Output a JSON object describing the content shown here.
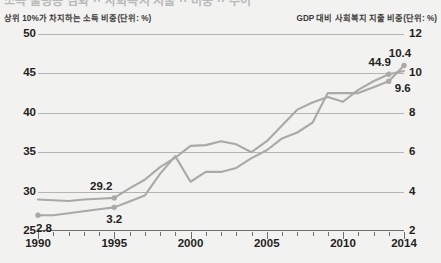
{
  "page": {
    "cropped_title_ghost": "소득 불평등 심화 ·· 사회복지 지출 ·· 비중 ·· 추이"
  },
  "axis_captions": {
    "left": "상위 10%가 차지하는 소득 비중(단위: %)",
    "right": "GDP 대비 사회복지 지출 비중(단위: %)"
  },
  "chart_data": {
    "type": "line",
    "title": "",
    "xlabel": "",
    "ylabel": "상위 10%가 차지하는 소득 비중(단위: %)",
    "y2label": "GDP 대비 사회복지 지출 비중(단위: %)",
    "grid": true,
    "legend": "none",
    "xlim": [
      1990,
      2014
    ],
    "ylim": [
      25,
      50
    ],
    "y2lim": [
      2,
      12
    ],
    "x": [
      1990,
      1991,
      1992,
      1993,
      1994,
      1995,
      1996,
      1997,
      1998,
      1999,
      2000,
      2001,
      2002,
      2003,
      2004,
      2005,
      2006,
      2007,
      2008,
      2009,
      2010,
      2011,
      2012,
      2013,
      2014
    ],
    "xticks": [
      "1990",
      "1995",
      "2000",
      "2005",
      "2010",
      "2014"
    ],
    "yticks": [
      "25",
      "30",
      "35",
      "40",
      "45",
      "50"
    ],
    "y2ticks": [
      "2",
      "4",
      "6",
      "8",
      "10",
      "12"
    ],
    "series": [
      {
        "name": "상위 10%가 차지하는 소득 비중",
        "axis": "left",
        "color": "#a9a9a7",
        "values": [
          29.0,
          28.9,
          28.8,
          29.0,
          29.1,
          29.2,
          30.4,
          31.5,
          33.1,
          34.3,
          35.8,
          35.9,
          36.4,
          36.0,
          35.0,
          36.4,
          38.4,
          40.4,
          41.3,
          42.0,
          41.4,
          42.9,
          44.0,
          44.9,
          45.3
        ],
        "labeled_points": [
          {
            "x": 1995,
            "value": 29.2,
            "label": "29.2"
          },
          {
            "x": 2013,
            "value": 44.9,
            "label": "44.9"
          }
        ]
      },
      {
        "name": "GDP 대비 사회복지 지출 비중",
        "axis": "right",
        "color": "#a9a9a7",
        "values": [
          2.8,
          2.8,
          2.9,
          3.0,
          3.1,
          3.2,
          3.5,
          3.8,
          4.9,
          5.8,
          4.5,
          5.0,
          5.0,
          5.2,
          5.7,
          6.1,
          6.7,
          7.0,
          7.5,
          9.0,
          9.0,
          9.0,
          9.3,
          9.6,
          10.4
        ],
        "labeled_points": [
          {
            "x": 1990,
            "value": 2.8,
            "label": "2.8"
          },
          {
            "x": 1995,
            "value": 3.2,
            "label": "3.2"
          },
          {
            "x": 2013,
            "value": 9.6,
            "label": "9.6"
          },
          {
            "x": 2014,
            "value": 10.4,
            "label": "10.4"
          }
        ]
      }
    ]
  },
  "style": {
    "background": "#f2f2f0",
    "line_color": "#a9a9a7",
    "grid_color": "#b4b4b2",
    "axis_color": "#6e6e6c",
    "text_color": "#231f20"
  }
}
